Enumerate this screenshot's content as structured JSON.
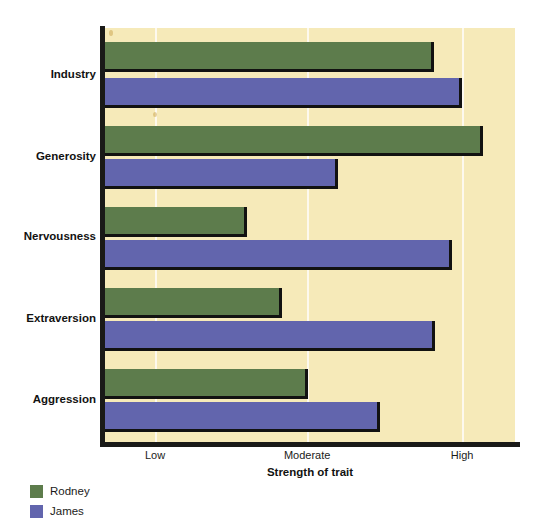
{
  "chart_data": {
    "type": "bar",
    "orientation": "horizontal",
    "title": "",
    "xlabel": "Strength of trait",
    "ylabel": "",
    "categories": [
      "Industry",
      "Generosity",
      "Nervousness",
      "Extraversion",
      "Aggression"
    ],
    "tick_labels": [
      "Low",
      "Moderate",
      "High"
    ],
    "tick_positions_pct": [
      12.2,
      49.3,
      87.1
    ],
    "xlim_labels": [
      "Low",
      "High"
    ],
    "grid": true,
    "legend_position": "bottom-left",
    "series": [
      {
        "name": "Rodney",
        "color": "#5d7c4c",
        "values_pct": [
          80.2,
          92.2,
          34.6,
          43.2,
          49.5
        ],
        "values_qualitative": [
          "High",
          "Very high",
          "Low",
          "Low-moderate",
          "Moderate"
        ]
      },
      {
        "name": "James",
        "color": "#6265ad",
        "values_pct": [
          87.1,
          56.8,
          84.6,
          80.5,
          67.1
        ],
        "values_qualitative": [
          "High",
          "Moderate",
          "High",
          "High",
          "Moderate-high"
        ]
      }
    ]
  },
  "axis": {
    "x_title": "Strength of trait",
    "ticks": [
      {
        "label": "Low",
        "pos_pct": 12.2
      },
      {
        "label": "Moderate",
        "pos_pct": 49.3
      },
      {
        "label": "High",
        "pos_pct": 87.1
      }
    ]
  },
  "legend": {
    "items": [
      {
        "label": "Rodney",
        "color": "#5d7c4c"
      },
      {
        "label": "James",
        "color": "#6265ad"
      }
    ]
  },
  "colors": {
    "plot_background": "#f6eab9",
    "page_background": "#ffffff",
    "axis": "#1a1a18",
    "gridline": "#fdfaf0",
    "rodney": "#5d7c4c",
    "james": "#6265ad"
  }
}
